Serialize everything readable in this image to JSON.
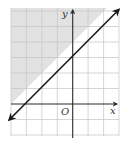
{
  "graph": {
    "type": "linear-inequality",
    "inequality": "y ≥ x + 3",
    "boundary_line": {
      "slope": 1,
      "y_intercept": 3,
      "x_intercept": -3,
      "style": "solid",
      "arrows": "both"
    },
    "shaded_region": "above-left of line",
    "x_range": [
      -4,
      3
    ],
    "y_range": [
      -2,
      6
    ],
    "grid_unit": 1,
    "labels": {
      "x_axis": "x",
      "y_axis": "y",
      "origin": "O"
    },
    "colors": {
      "shade": "#e2e2e2",
      "grid": "#c4c4c4",
      "axis": "#2a2a2a",
      "line": "#1a1a1a",
      "background": "#ffffff"
    }
  }
}
